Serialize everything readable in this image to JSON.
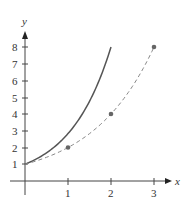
{
  "chart_data": {
    "type": "line",
    "title": "",
    "xlabel": "x",
    "ylabel": "y",
    "xlim": [
      0,
      3.4
    ],
    "ylim": [
      0,
      8.8
    ],
    "x_ticks": [
      "1",
      "2",
      "3"
    ],
    "y_ticks": [
      "1",
      "2",
      "3",
      "4",
      "5",
      "6",
      "7",
      "8"
    ],
    "grid": false,
    "legend": null,
    "series": [
      {
        "name": "solid curve",
        "style": "solid",
        "color": "#555555",
        "x": [
          0,
          0.25,
          0.5,
          0.75,
          1.0,
          1.25,
          1.5,
          1.75,
          2.0
        ],
        "y": [
          1.0,
          1.3,
          1.68,
          2.18,
          2.83,
          3.67,
          4.76,
          6.17,
          8.0
        ]
      },
      {
        "name": "dashed curve",
        "style": "dashed",
        "color": "#888888",
        "x": [
          0,
          0.5,
          1,
          1.5,
          2,
          2.5,
          3
        ],
        "y": [
          1,
          1.41,
          2,
          2.83,
          4,
          5.66,
          8
        ],
        "markers": [
          {
            "x": 1,
            "y": 2
          },
          {
            "x": 2,
            "y": 4
          },
          {
            "x": 3,
            "y": 8
          }
        ]
      }
    ]
  },
  "labels": {
    "x_axis": "x",
    "y_axis": "y",
    "x_ticks": [
      "1",
      "2",
      "3"
    ],
    "y_ticks": [
      "1",
      "2",
      "3",
      "4",
      "5",
      "6",
      "7",
      "8"
    ]
  }
}
